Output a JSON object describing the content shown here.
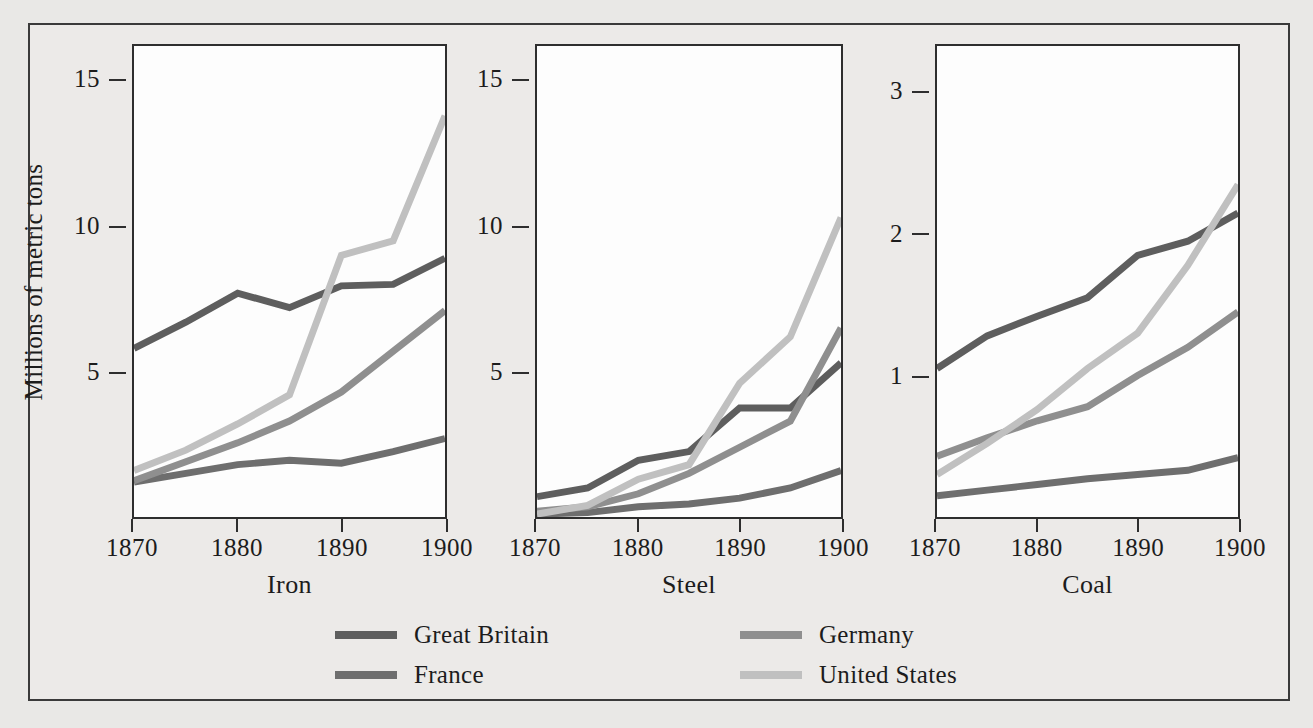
{
  "figure": {
    "ylabel": "Millions of metric tons",
    "background": "#eceae8",
    "plot_background": "#fdfdfd",
    "border_color": "#3a3a3a"
  },
  "series_colors": {
    "great_britain": "#5e5e5e",
    "france": "#6e6e6e",
    "germany": "#8f8f8f",
    "united_states": "#c0c0c0"
  },
  "legend": {
    "columns": [
      {
        "items": [
          {
            "label": "Great Britain",
            "color": "#5e5e5e",
            "key": "great_britain"
          },
          {
            "label": "France",
            "color": "#6e6e6e",
            "key": "france"
          }
        ]
      },
      {
        "items": [
          {
            "label": "Germany",
            "color": "#8f8f8f",
            "key": "germany"
          },
          {
            "label": "United States",
            "color": "#c0c0c0",
            "key": "united_states"
          }
        ]
      }
    ]
  },
  "panels": [
    {
      "title": "Iron",
      "yticks": [
        5,
        10,
        15
      ],
      "ylim": [
        0,
        16.2
      ],
      "xticks": [
        1870,
        1880,
        1890,
        1900
      ],
      "xlim": [
        1870,
        1900
      ]
    },
    {
      "title": "Steel",
      "yticks": [
        5,
        10,
        15
      ],
      "ylim": [
        0,
        16.2
      ],
      "xticks": [
        1870,
        1880,
        1890,
        1900
      ],
      "xlim": [
        1870,
        1900
      ]
    },
    {
      "title": "Coal",
      "yticks": [
        1,
        2,
        3
      ],
      "ylim": [
        0,
        3.33
      ],
      "xticks": [
        1870,
        1880,
        1890,
        1900
      ],
      "xlim": [
        1870,
        1900
      ]
    }
  ],
  "chart_data": {
    "type": "line",
    "title": "",
    "xlabel": "",
    "ylabel": "Millions of metric tons",
    "grid": false,
    "legend_position": "bottom",
    "x": [
      1870,
      1875,
      1880,
      1885,
      1890,
      1895,
      1900
    ],
    "panels": [
      {
        "name": "Iron",
        "ylim": [
          0,
          16.2
        ],
        "yticks": [
          5,
          10,
          15
        ],
        "xlim": [
          1870,
          1900
        ],
        "xticks": [
          1870,
          1880,
          1890,
          1900
        ],
        "series": [
          {
            "name": "Great Britain",
            "values": [
              5.8,
              6.7,
              7.7,
              7.2,
              7.95,
              8.0,
              8.9
            ]
          },
          {
            "name": "Germany",
            "values": [
              1.25,
              1.9,
              2.55,
              3.3,
              4.3,
              5.7,
              7.1
            ]
          },
          {
            "name": "United States",
            "values": [
              1.6,
              2.3,
              3.2,
              4.2,
              9.0,
              9.5,
              13.8
            ]
          },
          {
            "name": "France",
            "values": [
              1.2,
              1.5,
              1.8,
              1.95,
              1.85,
              2.25,
              2.7
            ]
          }
        ]
      },
      {
        "name": "Steel",
        "ylim": [
          0,
          16.2
        ],
        "yticks": [
          5,
          10,
          15
        ],
        "xlim": [
          1870,
          1900
        ],
        "xticks": [
          1870,
          1880,
          1890,
          1900
        ],
        "series": [
          {
            "name": "Great Britain",
            "values": [
              0.7,
              1.0,
              1.95,
              2.25,
              3.75,
              3.75,
              5.3
            ]
          },
          {
            "name": "Germany",
            "values": [
              0.2,
              0.35,
              0.8,
              1.5,
              2.4,
              3.3,
              6.5
            ]
          },
          {
            "name": "United States",
            "values": [
              0.1,
              0.4,
              1.3,
              1.8,
              4.6,
              6.2,
              10.3
            ]
          },
          {
            "name": "France",
            "values": [
              0.1,
              0.15,
              0.35,
              0.45,
              0.65,
              1.0,
              1.6
            ]
          }
        ]
      },
      {
        "name": "Coal",
        "ylim": [
          0,
          3.33
        ],
        "yticks": [
          1,
          2,
          3
        ],
        "xlim": [
          1870,
          1900
        ],
        "xticks": [
          1870,
          1880,
          1890,
          1900
        ],
        "series": [
          {
            "name": "Great Britain",
            "values": [
              1.05,
              1.28,
              1.42,
              1.55,
              1.85,
              1.95,
              2.15
            ]
          },
          {
            "name": "Germany",
            "values": [
              0.43,
              0.56,
              0.68,
              0.78,
              1.0,
              1.2,
              1.45
            ]
          },
          {
            "name": "United States",
            "values": [
              0.3,
              0.52,
              0.76,
              1.05,
              1.3,
              1.78,
              2.35
            ]
          },
          {
            "name": "France",
            "values": [
              0.15,
              0.19,
              0.23,
              0.27,
              0.3,
              0.33,
              0.42
            ]
          }
        ]
      }
    ]
  }
}
